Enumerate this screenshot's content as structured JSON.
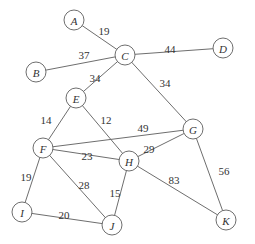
{
  "graph": {
    "type": "weighted-undirected-graph",
    "node_radius": 10,
    "nodes": [
      {
        "id": "A",
        "label": "A",
        "x": 74,
        "y": 20
      },
      {
        "id": "B",
        "label": "B",
        "x": 36,
        "y": 72
      },
      {
        "id": "C",
        "label": "C",
        "x": 125,
        "y": 55
      },
      {
        "id": "D",
        "label": "D",
        "x": 223,
        "y": 48
      },
      {
        "id": "E",
        "label": "E",
        "x": 76,
        "y": 98
      },
      {
        "id": "F",
        "label": "F",
        "x": 43,
        "y": 148
      },
      {
        "id": "G",
        "label": "G",
        "x": 193,
        "y": 129
      },
      {
        "id": "H",
        "label": "H",
        "x": 129,
        "y": 161
      },
      {
        "id": "I",
        "label": "I",
        "x": 22,
        "y": 212
      },
      {
        "id": "J",
        "label": "J",
        "x": 112,
        "y": 225
      },
      {
        "id": "K",
        "label": "K",
        "x": 226,
        "y": 220
      }
    ],
    "edges": [
      {
        "from": "A",
        "to": "C",
        "weight": "19",
        "lx": 104,
        "ly": 31
      },
      {
        "from": "B",
        "to": "C",
        "weight": "37",
        "lx": 84,
        "ly": 55
      },
      {
        "from": "C",
        "to": "D",
        "weight": "44",
        "lx": 170,
        "ly": 49
      },
      {
        "from": "C",
        "to": "E",
        "weight": "34",
        "lx": 95,
        "ly": 78
      },
      {
        "from": "C",
        "to": "G",
        "weight": "34",
        "lx": 165,
        "ly": 83
      },
      {
        "from": "E",
        "to": "F",
        "weight": "14",
        "lx": 46,
        "ly": 120
      },
      {
        "from": "E",
        "to": "H",
        "weight": "12",
        "lx": 106,
        "ly": 120
      },
      {
        "from": "F",
        "to": "G",
        "weight": "49",
        "lx": 143,
        "ly": 128
      },
      {
        "from": "F",
        "to": "H",
        "weight": "23",
        "lx": 87,
        "ly": 156
      },
      {
        "from": "G",
        "to": "H",
        "weight": "29",
        "lx": 149,
        "ly": 149
      },
      {
        "from": "F",
        "to": "I",
        "weight": "19",
        "lx": 26,
        "ly": 177
      },
      {
        "from": "F",
        "to": "J",
        "weight": "28",
        "lx": 84,
        "ly": 185
      },
      {
        "from": "H",
        "to": "J",
        "weight": "15",
        "lx": 115,
        "ly": 193
      },
      {
        "from": "I",
        "to": "J",
        "weight": "20",
        "lx": 64,
        "ly": 215
      },
      {
        "from": "H",
        "to": "K",
        "weight": "83",
        "lx": 174,
        "ly": 180
      },
      {
        "from": "G",
        "to": "K",
        "weight": "56",
        "lx": 224,
        "ly": 171
      }
    ]
  }
}
